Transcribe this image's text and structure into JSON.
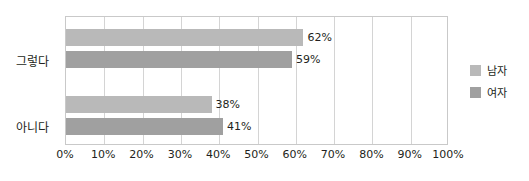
{
  "chart_data": {
    "type": "bar",
    "orientation": "horizontal",
    "title": "",
    "xlabel": "",
    "ylabel": "",
    "xlim": [
      0,
      100
    ],
    "xticks": [
      "0%",
      "10%",
      "20%",
      "30%",
      "40%",
      "50%",
      "60%",
      "70%",
      "80%",
      "90%",
      "100%"
    ],
    "xtick_values": [
      0,
      10,
      20,
      30,
      40,
      50,
      60,
      70,
      80,
      90,
      100
    ],
    "grid": true,
    "legend_position": "right",
    "categories": [
      "그렇다",
      "아니다"
    ],
    "series": [
      {
        "name": "남자",
        "color": "#b9b9b9",
        "values": [
          62,
          59
        ],
        "labels": [
          "62%",
          "59%"
        ]
      },
      {
        "name": "여자",
        "color": "#a0a0a0",
        "values": [
          38,
          41
        ],
        "labels": [
          "38%",
          "41%"
        ]
      }
    ],
    "bars": [
      {
        "category": "그렇다",
        "series": "남자",
        "value": 62,
        "label": "62%",
        "color": "#b9b9b9",
        "top": 28
      },
      {
        "category": "그렇다",
        "series": "여자",
        "value": 59,
        "label": "59%",
        "color": "#a0a0a0",
        "top": 50
      },
      {
        "category": "아니다",
        "series": "남자",
        "value": 38,
        "label": "38%",
        "color": "#b9b9b9",
        "top": 95
      },
      {
        "category": "아니다",
        "series": "여자",
        "value": 41,
        "label": "41%",
        "color": "#a0a0a0",
        "top": 117
      }
    ]
  },
  "axis": {
    "ticks": [
      {
        "label": "0%",
        "value": 0
      },
      {
        "label": "10%",
        "value": 10
      },
      {
        "label": "20%",
        "value": 20
      },
      {
        "label": "30%",
        "value": 30
      },
      {
        "label": "40%",
        "value": 40
      },
      {
        "label": "50%",
        "value": 50
      },
      {
        "label": "60%",
        "value": 60
      },
      {
        "label": "70%",
        "value": 70
      },
      {
        "label": "80%",
        "value": 80
      },
      {
        "label": "90%",
        "value": 90
      },
      {
        "label": "100%",
        "value": 100
      }
    ]
  },
  "categories": [
    {
      "label": "그렇다",
      "top": 52
    },
    {
      "label": "아니다",
      "top": 118
    }
  ],
  "legend": {
    "items": [
      {
        "label": "남자",
        "color": "#b9b9b9",
        "swatch": "legend-swatch-male"
      },
      {
        "label": "여자",
        "color": "#a0a0a0",
        "swatch": "legend-swatch-female"
      }
    ]
  }
}
